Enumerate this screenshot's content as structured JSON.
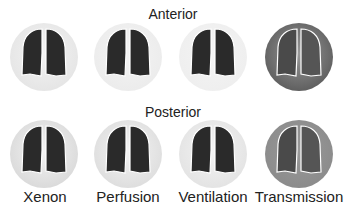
{
  "headings": {
    "anterior": "Anterior",
    "posterior": "Posterior"
  },
  "columns": [
    {
      "label": "Xenon",
      "bg_anterior": "#e4e4e4",
      "bg_posterior": "#d8d8d8",
      "edge": "light"
    },
    {
      "label": "Perfusion",
      "bg_anterior": "#ebebeb",
      "bg_posterior": "#dcdcdc",
      "edge": "light"
    },
    {
      "label": "Ventilation",
      "bg_anterior": "#eeeeee",
      "bg_posterior": "#e2e2e2",
      "edge": "light"
    },
    {
      "label": "Transmission",
      "bg_anterior": "#5a5a5a",
      "bg_posterior": "#8a8a8a",
      "edge": "dark"
    }
  ],
  "colors": {
    "lung": "#2a2a2a",
    "outline": "#ffffff",
    "text": "#222222"
  }
}
